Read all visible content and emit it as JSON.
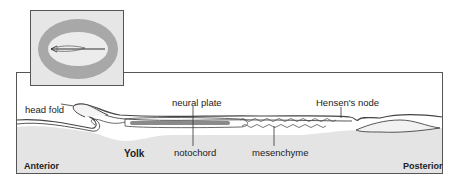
{
  "figure": {
    "type": "chick embryo sagittal section diagram",
    "inset": {
      "description": "dorsal view of early embryo with area opaca ring and primitive streak"
    },
    "labels": {
      "head_fold": "head fold",
      "neural_plate": "neural plate",
      "hensens_node": "Hensen's node",
      "yolk": "Yolk",
      "notochord": "notochord",
      "mesenchyme": "mesenchyme",
      "anterior": "Anterior",
      "posterior": "Posterior"
    },
    "colors": {
      "yolk_fill": "#e4e4e4",
      "notochord_fill": "#8a8a8a",
      "outline": "#444444",
      "area_opaca": "#a8a8a8"
    }
  }
}
